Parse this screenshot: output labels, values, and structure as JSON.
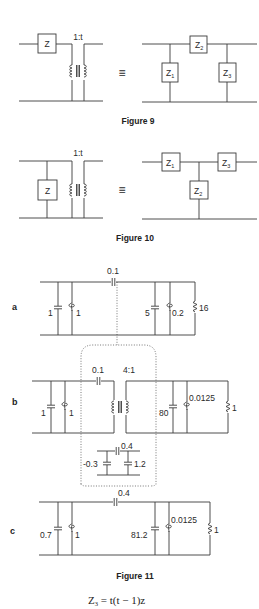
{
  "figure9": {
    "caption": "Figure 9",
    "left": {
      "impedance": "Z",
      "ratio": "1:t"
    },
    "equivalence_symbol": "≡",
    "right": {
      "z1": {
        "main": "Z",
        "sub": "1"
      },
      "z2": {
        "main": "Z",
        "sub": "2"
      },
      "z3": {
        "main": "Z",
        "sub": "3"
      }
    }
  },
  "figure10": {
    "caption": "Figure 10",
    "left": {
      "impedance": "Z",
      "ratio": "1:t"
    },
    "equivalence_symbol": "≡",
    "right": {
      "z1": {
        "main": "Z",
        "sub": "1"
      },
      "z2": {
        "main": "Z",
        "sub": "2"
      },
      "z3": {
        "main": "Z",
        "sub": "3"
      }
    }
  },
  "figure11": {
    "caption": "Figure 11",
    "a": {
      "label": "a",
      "shunt_cap_left": "1",
      "shunt_ind_left": "1",
      "series_cap": "0.1",
      "shunt_cap_right": "5",
      "shunt_ind_right": "0.2",
      "load_res": "16"
    },
    "b": {
      "label": "b",
      "shunt_cap_left": "1",
      "shunt_ind_left": "1",
      "series_cap": "0.1",
      "transformer_ratio": "4:1",
      "shunt_cap_right": "80",
      "shunt_ind_right": "0.0125",
      "load_res": "1",
      "pi_series_cap": "0.4",
      "pi_shunt_cap_left": "-0.3",
      "pi_shunt_cap_right": "1.2"
    },
    "c": {
      "label": "c",
      "shunt_cap_left": "0.7",
      "shunt_ind_left": "1",
      "series_cap": "0.4",
      "shunt_cap_right": "81.2",
      "shunt_ind_right": "0.0125",
      "load_res": "1"
    }
  },
  "equation": {
    "lhs": "Z",
    "lhs_sub": "3",
    "rhs": " = t(t − 1)z"
  }
}
